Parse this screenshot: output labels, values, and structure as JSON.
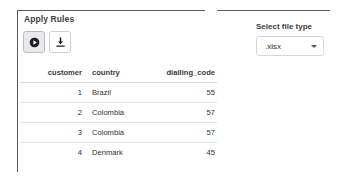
{
  "left_panel": {
    "section_title": "Apply Rules",
    "actions": [
      {
        "name": "run-button",
        "icon": "play-circle-icon",
        "state": "pressed"
      },
      {
        "name": "download-button",
        "icon": "download-icon",
        "state": "default"
      }
    ],
    "table": {
      "columns": [
        "customer",
        "country",
        "dialling_code"
      ],
      "rows": [
        {
          "customer": "1",
          "country": "Brazil",
          "dialling_code": "55"
        },
        {
          "customer": "2",
          "country": "Colombia",
          "dialling_code": "57"
        },
        {
          "customer": "3",
          "country": "Colombia",
          "dialling_code": "57"
        },
        {
          "customer": "4",
          "country": "Denmark",
          "dialling_code": "45"
        }
      ]
    }
  },
  "right_panel": {
    "select_label": "Select file type",
    "file_type": {
      "value": ".xlsx",
      "options": [
        ".xlsx",
        ".csv"
      ]
    }
  },
  "colors": {
    "rule": "#5a5a5f",
    "text": "#262730",
    "row_divider": "#e4e4e8",
    "button_pressed_bg": "#e9e9ec"
  }
}
